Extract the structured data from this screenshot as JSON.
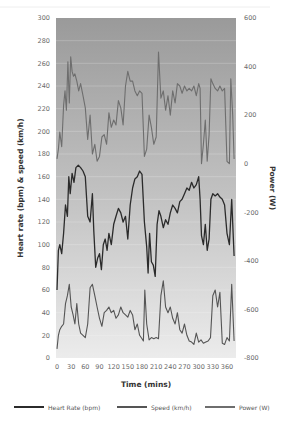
{
  "chart_data": {
    "type": "line",
    "title": "",
    "xlabel": "Time (mins)",
    "ylabel": "Heart rate (bpm) & speed (km/h)",
    "y2label": "Power (W)",
    "xlim": [
      0,
      379
    ],
    "ylim": [
      0,
      300
    ],
    "y2lim": [
      -800,
      600
    ],
    "x_ticks": [
      0,
      30,
      60,
      90,
      120,
      150,
      180,
      210,
      240,
      270,
      300,
      330,
      360
    ],
    "y_ticks": [
      0,
      20,
      40,
      60,
      80,
      100,
      120,
      140,
      160,
      180,
      200,
      220,
      240,
      260,
      280,
      300
    ],
    "y2_ticks": [
      -800,
      -600,
      -400,
      -200,
      0,
      200,
      400,
      600
    ],
    "grid": true,
    "legend_position": "bottom",
    "background": "vertical gradient, dark gray top to light gray bottom",
    "series": [
      {
        "name": "Heart Rate (bpm)",
        "axis": "left",
        "color": "#2b2b2b",
        "x": [
          0,
          3,
          6,
          10,
          14,
          18,
          22,
          25,
          28,
          32,
          36,
          40,
          45,
          50,
          55,
          60,
          65,
          70,
          75,
          78,
          82,
          86,
          90,
          94,
          98,
          102,
          106,
          110,
          115,
          120,
          125,
          130,
          135,
          140,
          145,
          150,
          155,
          160,
          165,
          170,
          175,
          180,
          185,
          190,
          193,
          196,
          200,
          204,
          208,
          212,
          216,
          220,
          225,
          230,
          235,
          240,
          245,
          250,
          255,
          260,
          265,
          270,
          275,
          280,
          285,
          290,
          295,
          300,
          303,
          306,
          310,
          314,
          318,
          322,
          326,
          330,
          335,
          340,
          345,
          350,
          355,
          360,
          365,
          370,
          375
        ],
        "values": [
          60,
          95,
          100,
          92,
          110,
          135,
          125,
          160,
          145,
          163,
          155,
          168,
          170,
          168,
          165,
          160,
          125,
          120,
          145,
          112,
          80,
          88,
          92,
          78,
          100,
          105,
          95,
          110,
          100,
          118,
          125,
          132,
          128,
          120,
          125,
          105,
          135,
          150,
          158,
          160,
          165,
          162,
          120,
          98,
          75,
          110,
          85,
          82,
          72,
          118,
          130,
          125,
          115,
          122,
          118,
          128,
          135,
          132,
          128,
          138,
          140,
          145,
          150,
          148,
          155,
          150,
          153,
          160,
          140,
          108,
          100,
          118,
          95,
          105,
          140,
          145,
          143,
          145,
          142,
          140,
          135,
          110,
          100,
          140,
          90
        ]
      },
      {
        "name": "Speed (km/h)",
        "axis": "left",
        "color": "#555555",
        "x": [
          0,
          3,
          6,
          10,
          14,
          18,
          22,
          26,
          30,
          34,
          38,
          42,
          46,
          50,
          55,
          60,
          65,
          70,
          75,
          80,
          85,
          90,
          95,
          100,
          105,
          110,
          115,
          120,
          125,
          130,
          135,
          140,
          145,
          150,
          155,
          160,
          165,
          170,
          175,
          180,
          183,
          186,
          190,
          195,
          200,
          205,
          210,
          215,
          220,
          225,
          230,
          235,
          240,
          245,
          250,
          255,
          260,
          265,
          270,
          275,
          280,
          285,
          290,
          295,
          300,
          305,
          310,
          315,
          320,
          325,
          330,
          335,
          340,
          345,
          350,
          355,
          360,
          365,
          370,
          375
        ],
        "values": [
          8,
          20,
          25,
          28,
          30,
          48,
          55,
          65,
          45,
          38,
          30,
          48,
          30,
          22,
          20,
          18,
          30,
          62,
          65,
          55,
          45,
          35,
          28,
          40,
          42,
          45,
          40,
          42,
          35,
          38,
          45,
          40,
          38,
          36,
          42,
          38,
          25,
          30,
          20,
          17,
          15,
          60,
          30,
          16,
          18,
          17,
          18,
          17,
          55,
          68,
          45,
          40,
          45,
          35,
          30,
          40,
          25,
          22,
          30,
          20,
          15,
          14,
          12,
          22,
          14,
          16,
          13,
          14,
          15,
          18,
          55,
          60,
          45,
          58,
          13,
          12,
          18,
          15,
          65,
          15
        ]
      },
      {
        "name": "Power (W)",
        "axis": "right",
        "color": "#6e6e6e",
        "x": [
          0,
          3,
          6,
          10,
          14,
          17,
          20,
          23,
          26,
          29,
          32,
          35,
          38,
          42,
          46,
          50,
          55,
          60,
          65,
          70,
          75,
          80,
          85,
          90,
          95,
          100,
          105,
          110,
          115,
          120,
          125,
          130,
          135,
          140,
          145,
          150,
          155,
          160,
          165,
          170,
          175,
          180,
          185,
          190,
          195,
          200,
          205,
          210,
          215,
          220,
          225,
          230,
          235,
          240,
          245,
          250,
          255,
          260,
          265,
          270,
          275,
          280,
          285,
          290,
          295,
          300,
          303,
          306,
          310,
          314,
          318,
          322,
          326,
          330,
          335,
          340,
          345,
          350,
          355,
          360,
          365,
          368,
          372,
          375
        ],
        "values": [
          20,
          60,
          130,
          70,
          240,
          300,
          220,
          420,
          250,
          440,
          380,
          360,
          370,
          340,
          300,
          330,
          280,
          230,
          100,
          200,
          40,
          80,
          10,
          30,
          110,
          120,
          80,
          210,
          150,
          180,
          160,
          260,
          230,
          160,
          320,
          380,
          340,
          340,
          300,
          280,
          300,
          290,
          30,
          60,
          200,
          150,
          80,
          110,
          460,
          270,
          300,
          220,
          280,
          200,
          300,
          250,
          330,
          320,
          290,
          320,
          300,
          310,
          300,
          320,
          280,
          330,
          310,
          0,
          80,
          180,
          10,
          120,
          350,
          330,
          310,
          300,
          320,
          300,
          310,
          10,
          0,
          350,
          200,
          20
        ]
      }
    ]
  },
  "axes": {
    "x_title": "Time (mins)",
    "y_left_title": "Heart rate (bpm) & speed (km/h)",
    "y_right_title": "Power (W)"
  },
  "legend": {
    "items": [
      {
        "label": "Heart Rate (bpm)",
        "color": "#2b2b2b"
      },
      {
        "label": "Speed (km/h)",
        "color": "#555555"
      },
      {
        "label": "Power (W)",
        "color": "#6e6e6e"
      }
    ]
  }
}
